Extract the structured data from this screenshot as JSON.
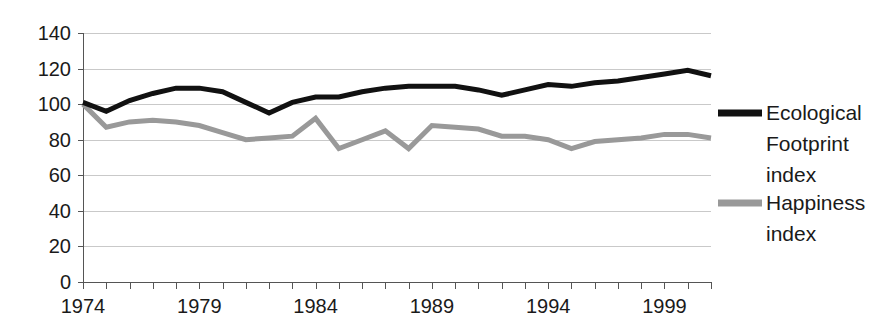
{
  "chart_data": {
    "type": "line",
    "title": "",
    "xlabel": "",
    "ylabel": "",
    "xlim": [
      1974,
      2001
    ],
    "ylim": [
      0,
      140
    ],
    "ytick_labels": [
      "0",
      "20",
      "40",
      "60",
      "80",
      "100",
      "120",
      "140"
    ],
    "ytick_values": [
      0,
      20,
      40,
      60,
      80,
      100,
      120,
      140
    ],
    "xtick_labels": [
      "1974",
      "1979",
      "1984",
      "1989",
      "1994",
      "1999"
    ],
    "xtick_values": [
      1974,
      1979,
      1984,
      1989,
      1994,
      1999
    ],
    "x": [
      1974,
      1975,
      1976,
      1977,
      1978,
      1979,
      1980,
      1981,
      1982,
      1983,
      1984,
      1985,
      1986,
      1987,
      1988,
      1989,
      1990,
      1991,
      1992,
      1993,
      1994,
      1995,
      1996,
      1997,
      1998,
      1999,
      2000,
      2001
    ],
    "grid": true,
    "grid_axis": "y",
    "legend_position": "right",
    "series": [
      {
        "name": "Ecological Footprint index",
        "color": "#111111",
        "width": 5,
        "values": [
          101,
          96,
          102,
          106,
          109,
          109,
          107,
          101,
          95,
          101,
          104,
          104,
          107,
          109,
          110,
          110,
          110,
          108,
          105,
          108,
          111,
          110,
          112,
          113,
          115,
          117,
          119,
          116
        ]
      },
      {
        "name": "Happiness index",
        "color": "#999999",
        "width": 5,
        "values": [
          100,
          87,
          90,
          91,
          90,
          88,
          84,
          80,
          81,
          82,
          92,
          75,
          80,
          85,
          75,
          88,
          87,
          86,
          82,
          82,
          80,
          75,
          79,
          80,
          81,
          83,
          83,
          81
        ]
      }
    ],
    "legend": [
      {
        "label_lines": [
          "Ecological",
          "Footprint",
          "index"
        ],
        "color": "#111111"
      },
      {
        "label_lines": [
          "Happiness",
          "index"
        ],
        "color": "#999999"
      }
    ]
  },
  "legend_entries": {
    "ecological": {
      "line1": "Ecological",
      "line2": "Footprint",
      "line3": "index"
    },
    "happiness": {
      "line1": "Happiness",
      "line2": "index"
    }
  }
}
